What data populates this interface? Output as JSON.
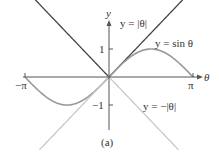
{
  "chart_data": {
    "type": "line",
    "title": "",
    "caption": "(a)",
    "xlabel": "θ",
    "ylabel": "y",
    "xlim": [
      -3.1416,
      3.1416
    ],
    "ylim": [
      -2.0,
      2.0
    ],
    "x_ticks": [
      {
        "value": -3.1416,
        "label": "−π"
      },
      {
        "value": 3.1416,
        "label": "π"
      }
    ],
    "y_ticks": [
      {
        "value": 1,
        "label": "1"
      },
      {
        "value": -1,
        "label": "−1"
      }
    ],
    "grid": false,
    "series": [
      {
        "name": "y = |θ|",
        "label": "y = |θ|",
        "color": "#444444",
        "function": "abs(theta)",
        "x_range": [
          -2.9,
          2.9
        ]
      },
      {
        "name": "y = sin θ",
        "label": "y = sin θ",
        "color": "#999999",
        "function": "sin(theta)",
        "x_range": [
          -3.1416,
          3.1416
        ]
      },
      {
        "name": "y = −|θ|",
        "label": "y = −|θ|",
        "color": "#c8c8c8",
        "function": "-abs(theta)",
        "x_range": [
          -2.6,
          2.6
        ]
      }
    ]
  },
  "labels": {
    "y_axis": "y",
    "x_axis": "θ",
    "x_neg_pi": "−π",
    "x_pos_pi": "π",
    "y_one": "1",
    "y_neg_one": "−1",
    "abs_label": "y = |θ|",
    "sin_label": "y = sin θ",
    "negabs_label": "y = −|θ|",
    "caption": "(a)"
  }
}
